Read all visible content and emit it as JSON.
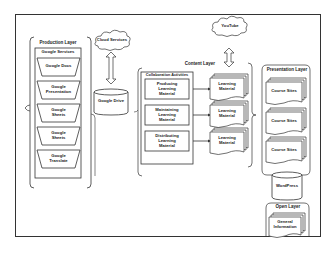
{
  "production_layer": {
    "title": "Production Layer",
    "group_title": "Google Services",
    "items": [
      {
        "label": "Google Docs"
      },
      {
        "label": "Google Presentation"
      },
      {
        "label": "Google Sheets"
      },
      {
        "label": "Google Sheets"
      },
      {
        "label": "Google Translate"
      }
    ]
  },
  "cloud_services": {
    "label": "Cloud Services"
  },
  "google_drive": {
    "label": "Google Drive"
  },
  "youtube": {
    "label": "YouTube"
  },
  "content_layer": {
    "title": "Content Layer",
    "group_title": "Collaboration Activities",
    "activities": [
      {
        "label": "Producing Learning Material"
      },
      {
        "label": "Maintaining Learning Material"
      },
      {
        "label": "Distributing Learning Material"
      }
    ],
    "outputs": [
      {
        "label": "Learning Material"
      },
      {
        "label": "Learning Material"
      },
      {
        "label": "Learning Material"
      }
    ]
  },
  "presentation_layer": {
    "title": "Presentation Layer",
    "items": [
      {
        "label": "Course Sites"
      },
      {
        "label": "Course Sites"
      },
      {
        "label": "Course Sites"
      }
    ],
    "wordpress": {
      "label": "WordPress"
    }
  },
  "open_layer": {
    "title": "Open Layer",
    "items": [
      {
        "label": "General Information"
      },
      {
        "label": "RSS-Feed"
      }
    ]
  }
}
